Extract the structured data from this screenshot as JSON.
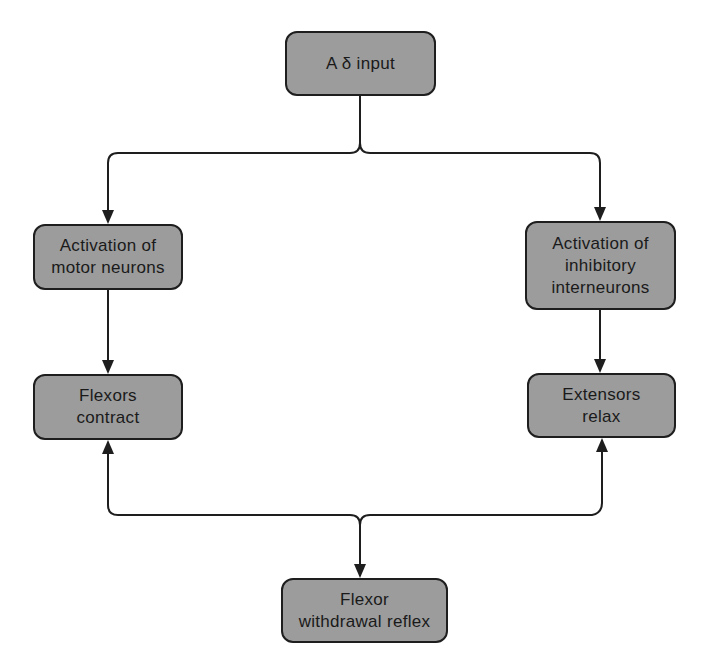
{
  "diagram": {
    "type": "flowchart",
    "colors": {
      "node_fill": "#9c9c9c",
      "node_border": "#1e1e1e",
      "text": "#1a1a1a",
      "connector": "#1e1e1e",
      "background": "#ffffff"
    },
    "nodes": {
      "input": {
        "lines": [
          "A δ input"
        ]
      },
      "motor": {
        "lines": [
          "Activation of",
          "motor neurons"
        ]
      },
      "inhibitory": {
        "lines": [
          "Activation of",
          "inhibitory",
          "interneurons"
        ]
      },
      "flexors": {
        "lines": [
          "Flexors",
          "contract"
        ]
      },
      "extensors": {
        "lines": [
          "Extensors",
          "relax"
        ]
      },
      "reflex": {
        "lines": [
          "Flexor",
          "withdrawal reflex"
        ]
      }
    },
    "edges": [
      {
        "from": "input",
        "to": "motor"
      },
      {
        "from": "input",
        "to": "inhibitory"
      },
      {
        "from": "motor",
        "to": "flexors"
      },
      {
        "from": "inhibitory",
        "to": "extensors"
      },
      {
        "from": "junction",
        "to": "flexors"
      },
      {
        "from": "junction",
        "to": "extensors"
      },
      {
        "from": "junction",
        "to": "reflex"
      }
    ]
  }
}
